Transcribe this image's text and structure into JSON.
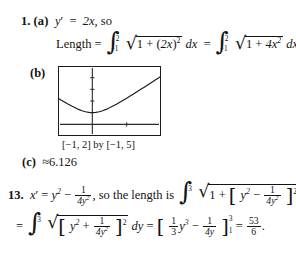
{
  "document": {
    "type": "math-solutions-page",
    "problems": [
      {
        "number": "1.",
        "parts": [
          {
            "label": "(a)",
            "text_prefix": "y′ = 2x, so",
            "derivative": "y' = 2x",
            "equation_label": "Length =",
            "integral_1": {
              "lower": "−1",
              "upper": "2",
              "integrand": "√(1 + (2x)²)",
              "differential": "dx"
            },
            "integral_2": {
              "lower": "−1",
              "upper": "2",
              "integrand": "√(1 + 4x²)",
              "differential": "dx"
            }
          },
          {
            "label": "(b)",
            "graph_caption": "[−1, 2] by [−1, 5]"
          },
          {
            "label": "(c)",
            "value": "≈6.126"
          }
        ]
      },
      {
        "number": "13.",
        "line1": {
          "derivative": "x' = y² − 1/(4y²),",
          "connector": "so the length is",
          "integral": {
            "lower": "1",
            "upper": "3",
            "differential": "dy"
          }
        },
        "line2": {
          "equals": "=",
          "integral": {
            "lower": "1",
            "upper": "3",
            "differential": "dy"
          },
          "antiderivative": "[ (1/3)y³ − 1/(4y) ]",
          "eval_lower": "1",
          "eval_upper": "3",
          "result_numerator": "53",
          "result_denominator": "6",
          "trailing_punct": "."
        }
      }
    ]
  },
  "symbols": {
    "integral": "∫",
    "radical": "√",
    "approx": "≈",
    "minus": "−",
    "prime": "′",
    "one": "1",
    "two": "2",
    "three": "3",
    "four": "4",
    "four_y2": "4y²",
    "four_y": "4y",
    "eq": "=",
    "plus": "+",
    "x": "x",
    "y": "y",
    "dx": "dx",
    "dy": "dy",
    "two_x": "2x",
    "four_x2": "4x²"
  },
  "chart_data": {
    "type": "line",
    "title": "",
    "xlabel": "",
    "ylabel": "",
    "caption": "[−1, 2] by [−1, 5]",
    "xlim": [
      -1,
      2
    ],
    "ylim": [
      -1,
      5
    ],
    "grid": false,
    "legend": "none",
    "axis_ticks_x": [
      -1,
      0,
      1,
      2
    ],
    "axis_ticks_y": [
      -1,
      0,
      1,
      2,
      3,
      4,
      5
    ],
    "series": [
      {
        "name": "y = √(1 + 4x²)",
        "x": [
          -1.0,
          -0.9,
          -0.8,
          -0.7,
          -0.6,
          -0.5,
          -0.4,
          -0.3,
          -0.2,
          -0.1,
          0.0,
          0.1,
          0.2,
          0.3,
          0.4,
          0.5,
          0.6,
          0.7,
          0.8,
          0.9,
          1.0,
          1.1,
          1.2,
          1.3,
          1.4,
          1.5,
          1.6,
          1.7,
          1.8,
          1.9,
          2.0
        ],
        "y": [
          2.236,
          2.059,
          1.887,
          1.72,
          1.562,
          1.414,
          1.281,
          1.166,
          1.077,
          1.02,
          1.0,
          1.02,
          1.077,
          1.166,
          1.281,
          1.414,
          1.562,
          1.72,
          1.887,
          2.059,
          2.236,
          2.417,
          2.6,
          2.786,
          2.973,
          3.162,
          3.352,
          3.542,
          3.733,
          3.924,
          4.123
        ]
      }
    ]
  },
  "colors": {
    "ink": "#141414",
    "page": "#ffffff",
    "curve": "#1b1b1b",
    "axis": "#2a2a2a"
  }
}
